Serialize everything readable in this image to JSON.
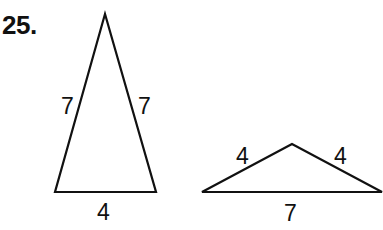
{
  "problem": {
    "number": "25."
  },
  "figures": [
    {
      "name": "tall-isosceles-triangle",
      "vertices": [
        [
          105,
          14
        ],
        [
          55,
          192
        ],
        [
          156,
          192
        ]
      ],
      "labels": {
        "left_side": "7",
        "right_side": "7",
        "base": "4"
      },
      "label_pos": {
        "left_side": [
          61,
          114
        ],
        "right_side": [
          138,
          114
        ],
        "base": [
          97,
          220
        ]
      }
    },
    {
      "name": "wide-isosceles-triangle",
      "vertices": [
        [
          292,
          144
        ],
        [
          202,
          192
        ],
        [
          382,
          192
        ]
      ],
      "labels": {
        "left_side": "4",
        "right_side": "4",
        "base": "7"
      },
      "label_pos": {
        "left_side": [
          236,
          164
        ],
        "right_side": [
          334,
          164
        ],
        "base": [
          284,
          221
        ]
      }
    }
  ]
}
